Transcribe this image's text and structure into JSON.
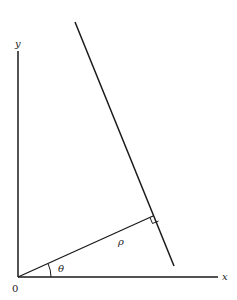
{
  "diagram": {
    "type": "normal-form line parameterization",
    "labels": {
      "y_axis": "y",
      "x_axis": "x",
      "origin": "0",
      "angle": "θ",
      "distance": "ρ"
    },
    "colors": {
      "stroke": "#1a1a1a",
      "background": "#ffffff"
    }
  }
}
